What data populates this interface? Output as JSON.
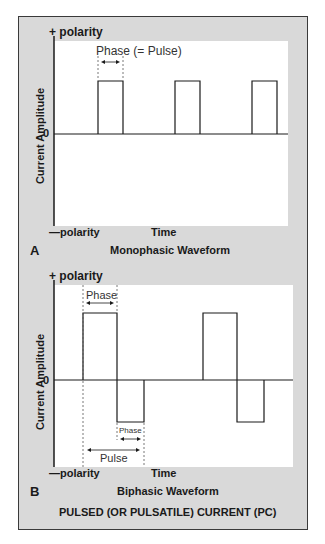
{
  "figure": {
    "title": "PULSED (OR PULSATILE) CURRENT (PC)",
    "colors": {
      "frame_bg": "#d9d9d9",
      "plot_bg": "#ffffff",
      "line": "#1a1a1a",
      "border": "#3a3a3a"
    }
  },
  "panel_a": {
    "letter": "A",
    "caption": "Monophasic Waveform",
    "y_axis_label": "Current Amplitude",
    "x_axis_label": "Time",
    "pos_polarity": "+ polarity",
    "neg_polarity": "—polarity",
    "zero_label": "0",
    "annotation_phase": "Phase (= Pulse)",
    "pulses": [
      {
        "start": 1,
        "end": 2,
        "amplitude": 1
      },
      {
        "start": 4,
        "end": 5,
        "amplitude": 1
      },
      {
        "start": 7,
        "end": 8,
        "amplitude": 1
      }
    ]
  },
  "panel_b": {
    "letter": "B",
    "caption": "Biphasic Waveform",
    "y_axis_label": "Current Amplitude",
    "x_axis_label": "Time",
    "pos_polarity": "+ polarity",
    "neg_polarity": "—polarity",
    "zero_label": "0",
    "annotation_phase_top": "Phase",
    "annotation_phase_bottom": "Phase",
    "annotation_pulse": "Pulse",
    "pulses": [
      {
        "positive_phase": {
          "start": 1,
          "end": 2,
          "amplitude": 1
        },
        "negative_phase": {
          "start": 2,
          "end": 2.8,
          "amplitude": -0.6
        }
      },
      {
        "positive_phase": {
          "start": 4.5,
          "end": 5.5,
          "amplitude": 1
        },
        "negative_phase": {
          "start": 5.5,
          "end": 6.3,
          "amplitude": -0.6
        }
      }
    ]
  }
}
